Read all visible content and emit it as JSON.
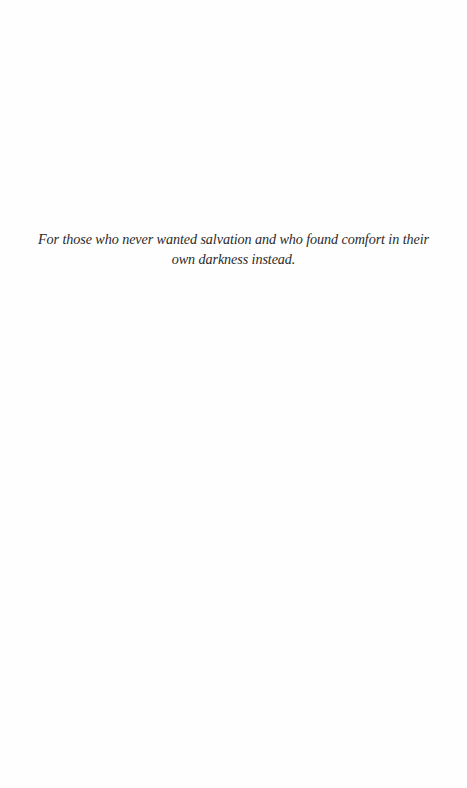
{
  "page": {
    "background": "#fefefe",
    "text_color": "#2b2b2b"
  },
  "dedication": {
    "lines": [
      "For those who never wanted salvation and who found comfort in their",
      "own darkness instead."
    ],
    "full_text": "For those who never wanted salvation and who found comfort in their own darkness instead."
  }
}
